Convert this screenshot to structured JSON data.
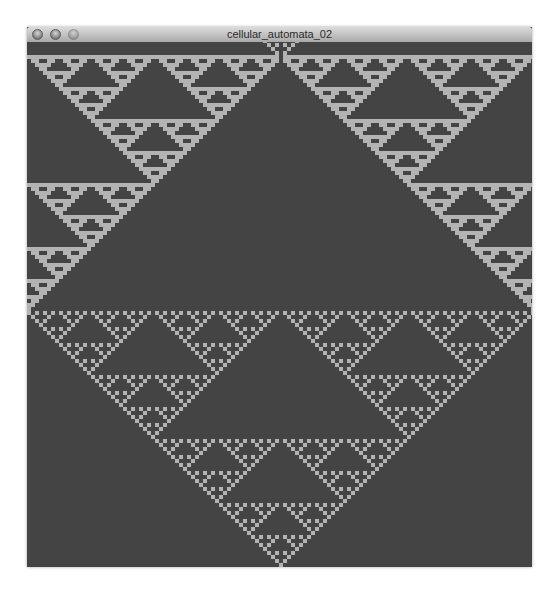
{
  "window": {
    "title": "cellular_automata_02",
    "controls": [
      {
        "name": "close",
        "icon": "close-circle-icon"
      },
      {
        "name": "minimize",
        "icon": "minimize-circle-icon"
      },
      {
        "name": "zoom",
        "icon": "zoom-circle-icon"
      }
    ]
  },
  "automaton": {
    "rule": 90,
    "cell_size_px": 4,
    "columns": 127,
    "rows": 132,
    "seed": "single-cell-bottom-center",
    "direction": "bottom-to-top",
    "wrap_edges": true,
    "colors": {
      "background": "#444444",
      "cell_on": "#b3b3b3"
    }
  },
  "caption": {
    "text": ""
  }
}
